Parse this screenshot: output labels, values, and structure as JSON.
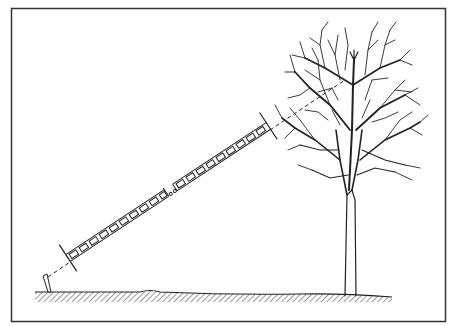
{
  "figure": {
    "description": "Line drawing of a segmented measuring tape stretched from a ground stake diagonally upward toward the crown of a leafless tree",
    "elements": {
      "frame": "rectangular border",
      "ground": "hatched ground line",
      "stake": "short ground stake at left",
      "tape": "segmented measuring tape with break in middle",
      "end_markers": "two perpendicular tick lines at tape ends",
      "sight_line": "dashed line continuing from stake through tape into tree crown",
      "tree": "bare deciduous tree with trunk and branching crown"
    },
    "colors": {
      "ink": "#222222",
      "background": "#ffffff"
    }
  }
}
